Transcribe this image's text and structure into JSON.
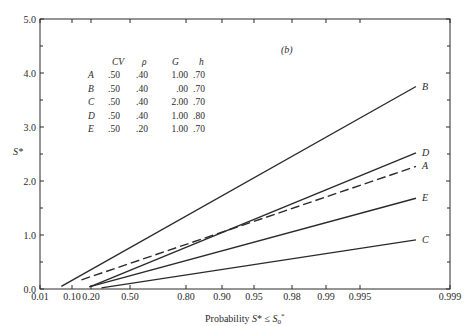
{
  "chart_data": {
    "type": "line",
    "panel_label": "(b)",
    "title": "",
    "xlabel": "Probability S* ≤ S*0",
    "ylabel": "S*",
    "x_scale": "normal-probability",
    "x_ticks": [
      "0.01",
      "0.10",
      "0.20",
      "0.50",
      "0.80",
      "0.90",
      "0.95",
      "0.98",
      "0.99",
      "0.995",
      "0.999"
    ],
    "y_ticks": [
      "0.0",
      "1.0",
      "2.0",
      "3.0",
      "4.0",
      "5.0"
    ],
    "ylim": [
      0,
      5
    ],
    "grid": false,
    "series": [
      {
        "name": "B",
        "style": "solid",
        "x": [
          0.07,
          0.998
        ],
        "y": [
          0.05,
          3.75
        ]
      },
      {
        "name": "D",
        "style": "solid",
        "x": [
          0.2,
          0.998
        ],
        "y": [
          0.05,
          2.52
        ]
      },
      {
        "name": "A",
        "style": "dashed",
        "x": [
          0.15,
          0.998
        ],
        "y": [
          0.17,
          2.27
        ]
      },
      {
        "name": "E",
        "style": "solid",
        "x": [
          0.19,
          0.998
        ],
        "y": [
          0.04,
          1.68
        ]
      },
      {
        "name": "C",
        "style": "solid",
        "x": [
          0.28,
          0.998
        ],
        "y": [
          0.02,
          0.91
        ]
      }
    ],
    "legend_table": {
      "headers": [
        "",
        "CV",
        "ρ",
        "G",
        "h"
      ],
      "rows": [
        [
          "A",
          ".50",
          ".40",
          "1.00",
          ".70"
        ],
        [
          "B",
          ".50",
          ".40",
          ".00",
          ".70"
        ],
        [
          "C",
          ".50",
          ".40",
          "2.00",
          ".70"
        ],
        [
          "D",
          ".50",
          ".40",
          "1.00",
          ".80"
        ],
        [
          "E",
          ".50",
          ".20",
          "1.00",
          ".70"
        ]
      ]
    }
  },
  "colors": {
    "ink": "#2a2a2a",
    "background": "#ffffff"
  }
}
